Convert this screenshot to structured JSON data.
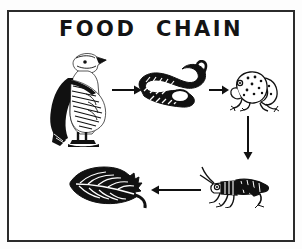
{
  "poster": {
    "title": "FOOD  CHAIN",
    "border_color": "#2b2b2b",
    "ink_color": "#111111",
    "background_color": "#ffffff"
  },
  "diagram": {
    "type": "food-chain-cycle",
    "nodes": [
      {
        "id": "eagle",
        "label": "eagle",
        "icon": "eagle-icon",
        "position": "top-left"
      },
      {
        "id": "snake",
        "label": "snake",
        "icon": "snake-icon",
        "position": "top-center"
      },
      {
        "id": "frog",
        "label": "frog",
        "icon": "frog-icon",
        "position": "top-right"
      },
      {
        "id": "grasshopper",
        "label": "grasshopper",
        "icon": "grasshopper-icon",
        "position": "bottom-right"
      },
      {
        "id": "leaf",
        "label": "leaf",
        "icon": "leaf-icon",
        "position": "bottom-left"
      }
    ],
    "arrows": [
      {
        "id": "eagle-to-snake",
        "from": "eagle",
        "to": "snake",
        "direction": "right"
      },
      {
        "id": "snake-to-frog",
        "from": "snake",
        "to": "frog",
        "direction": "right"
      },
      {
        "id": "frog-to-grasshopper",
        "from": "frog",
        "to": "grasshopper",
        "direction": "down"
      },
      {
        "id": "grasshopper-to-leaf",
        "from": "grasshopper",
        "to": "leaf",
        "direction": "left"
      }
    ]
  }
}
